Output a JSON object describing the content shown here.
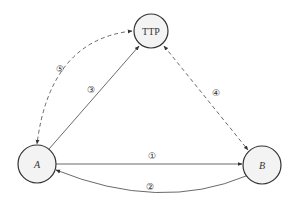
{
  "diagram": {
    "type": "protocol-flow",
    "nodes": [
      {
        "id": "TTP",
        "label": "TTP",
        "italic": false
      },
      {
        "id": "A",
        "label": "A",
        "italic": true
      },
      {
        "id": "B",
        "label": "B",
        "italic": true
      }
    ],
    "edges": [
      {
        "id": "1",
        "label": "①",
        "from": "A",
        "to": "B",
        "style": "solid"
      },
      {
        "id": "2",
        "label": "②",
        "from": "B",
        "to": "A",
        "style": "solid"
      },
      {
        "id": "3",
        "label": "③",
        "from": "A",
        "to": "TTP",
        "style": "solid"
      },
      {
        "id": "4",
        "label": "④",
        "from": "TTP",
        "to": "B",
        "style": "dashed",
        "bidirectional": true
      },
      {
        "id": "5",
        "label": "⑤",
        "from": "TTP",
        "to": "A",
        "style": "dashed",
        "bidirectional": true
      }
    ]
  }
}
